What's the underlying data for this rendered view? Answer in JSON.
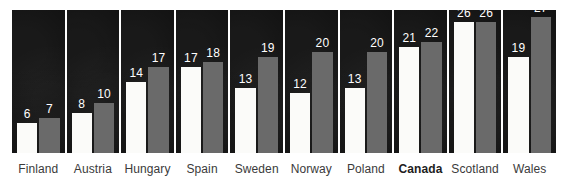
{
  "chart_data": {
    "type": "bar",
    "title": "",
    "subtitle": "",
    "xlabel": "",
    "ylabel": "",
    "ylim": [
      0,
      28
    ],
    "grid": false,
    "legend_position": "none",
    "layout": "small-multiples: one dark panel per country, two bars per panel",
    "categories": [
      "Finland",
      "Austria",
      "Hungary",
      "Spain",
      "Sweden",
      "Norway",
      "Poland",
      "Canada",
      "Scotland",
      "Wales"
    ],
    "highlight_category": "Canada",
    "series": [
      {
        "name": "series-a",
        "color": "#fbfbf9",
        "values": [
          6,
          8,
          14,
          17,
          13,
          12,
          13,
          21,
          26,
          19
        ]
      },
      {
        "name": "series-b",
        "color": "#6a6a6a",
        "values": [
          7,
          10,
          17,
          18,
          19,
          20,
          20,
          22,
          26,
          27
        ]
      }
    ],
    "value_labels": [
      [
        "6",
        "7"
      ],
      [
        "8",
        "10"
      ],
      [
        "14",
        "17"
      ],
      [
        "17",
        "18"
      ],
      [
        "13",
        "19"
      ],
      [
        "12",
        "20"
      ],
      [
        "13",
        "20"
      ],
      [
        "21",
        "22"
      ],
      [
        "26",
        "26"
      ],
      [
        "19",
        "27"
      ]
    ]
  },
  "style": {
    "panel_background": "#111111",
    "page_background": "#ffffff",
    "series_a_color": "#fbfbf9",
    "series_b_color": "#6a6a6a",
    "value_label_color": "#ffffff",
    "category_label_color": "#3a3a3a"
  }
}
